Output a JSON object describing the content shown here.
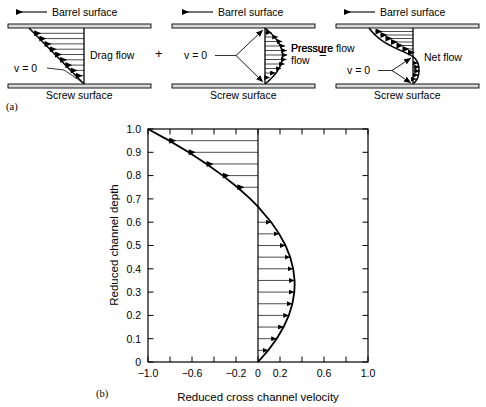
{
  "figure": {
    "panel_a_label": "(a)",
    "panel_b_label": "(b)"
  },
  "panel_a": {
    "operators": {
      "plus": "+",
      "equals": "="
    },
    "panels": [
      {
        "name": "drag-flow",
        "top_label": "Barrel surface",
        "bottom_label": "Screw surface",
        "flow_label": "Drag flow",
        "zero_label": "v = 0"
      },
      {
        "name": "pressure-flow",
        "top_label": "Barrel surface",
        "bottom_label": "Screw surface",
        "flow_label": "Pressure flow",
        "zero_label": "v = 0"
      },
      {
        "name": "net-flow",
        "top_label": "Barrel surface",
        "bottom_label": "Screw surface",
        "flow_label": "Net flow",
        "zero_label": "v = 0"
      }
    ]
  },
  "chart_data": {
    "type": "line",
    "title": "",
    "xlabel": "Reduced cross channel velocity",
    "ylabel": "Reduced channel depth",
    "xlim": [
      -1.0,
      1.0
    ],
    "ylim": [
      0,
      1.0
    ],
    "grid": false,
    "xticks": [
      -1.0,
      -0.8,
      -0.6,
      -0.4,
      -0.2,
      0,
      0.2,
      0.4,
      0.6,
      0.8,
      1.0
    ],
    "xticklabels": [
      "−1.0",
      "",
      "−0.6",
      "",
      "−0.2",
      "0",
      "0.2",
      "",
      "0.6",
      "",
      "1.0"
    ],
    "yticks": [
      0,
      0.1,
      0.2,
      0.3,
      0.4,
      0.5,
      0.6,
      0.7,
      0.8,
      0.9,
      1.0
    ],
    "yticklabels": [
      "0",
      "0.1",
      "0.2",
      "0.3",
      "0.4",
      "0.5",
      "0.6",
      "0.7",
      "0.8",
      "0.9",
      "1.0"
    ],
    "zero_line_x": 0,
    "series": [
      {
        "name": "Net cross channel velocity profile",
        "description": "v = y(3y - 2); negative (leftward) above y = 0.667, positive (rightward) below",
        "y": [
          0.0,
          0.05,
          0.1,
          0.15,
          0.2,
          0.25,
          0.3,
          0.3333,
          0.35,
          0.4,
          0.45,
          0.5,
          0.55,
          0.6,
          0.6667,
          0.7,
          0.75,
          0.8,
          0.85,
          0.9,
          0.95,
          1.0
        ],
        "v": [
          0.0,
          0.0925,
          0.17,
          0.2325,
          0.28,
          0.3125,
          0.33,
          0.3333,
          0.3325,
          0.32,
          0.2925,
          0.25,
          0.1925,
          0.12,
          0.0,
          -0.07,
          -0.1875,
          -0.32,
          -0.4675,
          -0.63,
          -0.8075,
          -1.0
        ],
        "arrow_rows": [
          {
            "y": 0.05,
            "v": 0.0925
          },
          {
            "y": 0.1,
            "v": 0.17
          },
          {
            "y": 0.15,
            "v": 0.2325
          },
          {
            "y": 0.2,
            "v": 0.28
          },
          {
            "y": 0.25,
            "v": 0.3125
          },
          {
            "y": 0.3,
            "v": 0.33
          },
          {
            "y": 0.35,
            "v": 0.3325
          },
          {
            "y": 0.4,
            "v": 0.32
          },
          {
            "y": 0.45,
            "v": 0.2925
          },
          {
            "y": 0.5,
            "v": 0.25
          },
          {
            "y": 0.55,
            "v": 0.1925
          },
          {
            "y": 0.6,
            "v": 0.12
          },
          {
            "y": 0.75,
            "v": -0.1875
          },
          {
            "y": 0.8,
            "v": -0.32
          },
          {
            "y": 0.85,
            "v": -0.4675
          },
          {
            "y": 0.9,
            "v": -0.63
          },
          {
            "y": 0.95,
            "v": -0.8075
          }
        ]
      }
    ]
  },
  "colors": {
    "ink": "#000000",
    "background": "#ffffff",
    "surface_fill": "#d9d9d9"
  }
}
